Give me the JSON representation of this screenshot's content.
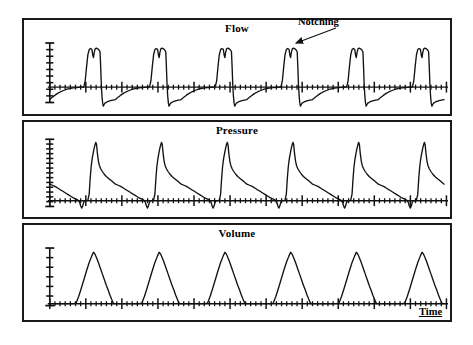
{
  "figure": {
    "kind": "respiratory-waveform-strip-chart",
    "background": "#ffffff",
    "trace_color": "#111111",
    "axis_color": "#111111",
    "border_color": "#1a1a1a"
  },
  "panels": [
    {
      "id": "flow",
      "title": "Flow"
    },
    {
      "id": "pressure",
      "title": "Pressure"
    },
    {
      "id": "volume",
      "title": "Volume"
    }
  ],
  "annotations": {
    "notching": "Notching",
    "time_axis": "Time"
  },
  "chart_data": {
    "type": "line",
    "subtitle": "",
    "xlabel": "Time",
    "ylabel": "",
    "grid": false,
    "legend_position": "none",
    "x_axis": {
      "label": "Time",
      "ticks_visible": true,
      "tick_labels": [],
      "minor_ticks_per_cycle": 14,
      "major_ticks_per_cycle": 2
    },
    "cycles": 6,
    "cycle_period": 1.0,
    "annotations": [
      {
        "text": "Notching",
        "panel": "flow",
        "points_to_cycle": 4,
        "feature": "plateau-notch",
        "arrow": true
      }
    ],
    "series": [
      {
        "name": "Flow",
        "panel": "flow",
        "ylim": [
          -1.15,
          1.25
        ],
        "baseline": 0,
        "y_axis_ticks": 9,
        "description": "Square-wave inspiratory flow with notched plateau, abrupt negative expiratory deflection, slow exponential return to baseline",
        "waveform": [
          [
            0.0,
            -0.62
          ],
          [
            0.04,
            -0.5
          ],
          [
            0.08,
            -0.4
          ],
          [
            0.12,
            -0.31
          ],
          [
            0.16,
            -0.24
          ],
          [
            0.2,
            -0.18
          ],
          [
            0.24,
            -0.13
          ],
          [
            0.28,
            -0.09
          ],
          [
            0.32,
            -0.06
          ],
          [
            0.36,
            -0.04
          ],
          [
            0.4,
            -0.02
          ],
          [
            0.44,
            -0.01
          ],
          [
            0.46,
            0.0
          ],
          [
            0.5,
            0.0
          ],
          [
            0.52,
            0.02
          ],
          [
            0.54,
            0.18
          ],
          [
            0.56,
            0.55
          ],
          [
            0.58,
            0.88
          ],
          [
            0.6,
            1.02
          ],
          [
            0.62,
            1.05
          ],
          [
            0.64,
            1.03
          ],
          [
            0.655,
            0.86
          ],
          [
            0.665,
            0.8
          ],
          [
            0.675,
            0.93
          ],
          [
            0.69,
            1.04
          ],
          [
            0.71,
            1.06
          ],
          [
            0.73,
            1.04
          ],
          [
            0.75,
            1.01
          ],
          [
            0.765,
            0.96
          ],
          [
            0.775,
            0.55
          ],
          [
            0.785,
            0.05
          ],
          [
            0.795,
            -0.45
          ],
          [
            0.805,
            -0.8
          ],
          [
            0.815,
            -0.95
          ],
          [
            0.825,
            -0.88
          ],
          [
            0.84,
            -0.8
          ],
          [
            0.87,
            -0.74
          ],
          [
            0.9,
            -0.7
          ],
          [
            0.94,
            -0.66
          ],
          [
            1.0,
            -0.62
          ]
        ]
      },
      {
        "name": "Pressure",
        "panel": "pressure",
        "ylim": [
          -0.32,
          1.15
        ],
        "baseline": 0,
        "y_axis_ticks": 14,
        "description": "Rapid pressure rise to peak, fast initial drop then slow exponential decay, brief sub-baseline dip before next breath",
        "waveform": [
          [
            0.0,
            0.3
          ],
          [
            0.04,
            0.28
          ],
          [
            0.08,
            0.26
          ],
          [
            0.12,
            0.23
          ],
          [
            0.16,
            0.2
          ],
          [
            0.2,
            0.17
          ],
          [
            0.24,
            0.14
          ],
          [
            0.28,
            0.11
          ],
          [
            0.32,
            0.08
          ],
          [
            0.36,
            0.05
          ],
          [
            0.4,
            0.03
          ],
          [
            0.43,
            0.01
          ],
          [
            0.455,
            -0.04
          ],
          [
            0.47,
            -0.13
          ],
          [
            0.485,
            -0.19
          ],
          [
            0.5,
            -0.14
          ],
          [
            0.515,
            -0.05
          ],
          [
            0.53,
            0.0
          ],
          [
            0.56,
            0.0
          ],
          [
            0.58,
            0.01
          ],
          [
            0.6,
            0.12
          ],
          [
            0.615,
            0.4
          ],
          [
            0.63,
            0.62
          ],
          [
            0.645,
            0.76
          ],
          [
            0.66,
            0.86
          ],
          [
            0.675,
            0.95
          ],
          [
            0.69,
            1.02
          ],
          [
            0.7,
            1.06
          ],
          [
            0.712,
            1.02
          ],
          [
            0.725,
            0.86
          ],
          [
            0.74,
            0.72
          ],
          [
            0.755,
            0.64
          ],
          [
            0.775,
            0.58
          ],
          [
            0.8,
            0.53
          ],
          [
            0.83,
            0.48
          ],
          [
            0.86,
            0.44
          ],
          [
            0.9,
            0.4
          ],
          [
            0.94,
            0.36
          ],
          [
            0.97,
            0.33
          ],
          [
            1.0,
            0.3
          ]
        ]
      },
      {
        "name": "Volume",
        "panel": "volume",
        "ylim": [
          -0.06,
          1.12
        ],
        "baseline": 0,
        "y_axis_ticks": 6,
        "description": "Triangular tidal volume: linear inspiratory ramp to peak, slightly concave expiratory decay, flat rest at baseline",
        "waveform": [
          [
            0.0,
            0.0
          ],
          [
            0.06,
            0.0
          ],
          [
            0.12,
            0.0
          ],
          [
            0.18,
            0.0
          ],
          [
            0.24,
            0.0
          ],
          [
            0.3,
            0.0
          ],
          [
            0.36,
            0.0
          ],
          [
            0.4,
            0.01
          ],
          [
            0.44,
            0.14
          ],
          [
            0.48,
            0.3
          ],
          [
            0.52,
            0.47
          ],
          [
            0.56,
            0.64
          ],
          [
            0.6,
            0.8
          ],
          [
            0.64,
            0.93
          ],
          [
            0.665,
            1.0
          ],
          [
            0.685,
            0.97
          ],
          [
            0.71,
            0.9
          ],
          [
            0.74,
            0.8
          ],
          [
            0.77,
            0.69
          ],
          [
            0.8,
            0.58
          ],
          [
            0.83,
            0.47
          ],
          [
            0.86,
            0.36
          ],
          [
            0.89,
            0.26
          ],
          [
            0.915,
            0.17
          ],
          [
            0.94,
            0.09
          ],
          [
            0.96,
            0.03
          ],
          [
            0.975,
            0.0
          ],
          [
            1.0,
            0.0
          ]
        ]
      }
    ]
  }
}
